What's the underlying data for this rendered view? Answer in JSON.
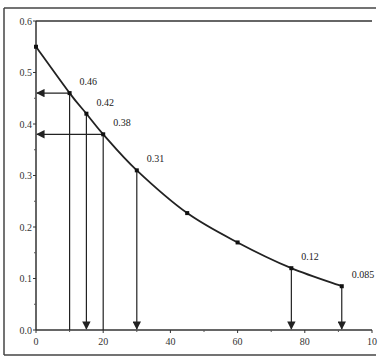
{
  "chart_data": {
    "type": "line",
    "title": "",
    "xlabel": "",
    "ylabel": "",
    "xlim": [
      0,
      100
    ],
    "ylim": [
      0,
      0.6
    ],
    "grid": false,
    "legend": null,
    "x_ticks": [
      "0",
      "20",
      "40",
      "60",
      "80",
      "10"
    ],
    "x_tick_values": [
      0,
      20,
      40,
      60,
      80,
      100
    ],
    "y_ticks": [
      "0.0",
      "0.1",
      "0.2",
      "0.3",
      "0.4",
      "0.5",
      "0.6"
    ],
    "y_tick_values": [
      0,
      0.1,
      0.2,
      0.3,
      0.4,
      0.5,
      0.6
    ],
    "series": [
      {
        "name": "curve",
        "x": [
          0,
          10,
          15,
          20,
          30,
          45,
          60,
          76,
          91
        ],
        "y": [
          0.55,
          0.46,
          0.42,
          0.38,
          0.31,
          0.227,
          0.17,
          0.12,
          0.085
        ]
      }
    ],
    "annotations": [
      {
        "x": 10,
        "y": 0.46,
        "text": "0.46",
        "arrow": "left-to-y-axis"
      },
      {
        "x": 15,
        "y": 0.42,
        "text": "0.42",
        "arrow": "down-to-x-axis"
      },
      {
        "x": 20,
        "y": 0.38,
        "text": "0.38",
        "arrow": "left-to-y-axis"
      },
      {
        "x": 30,
        "y": 0.31,
        "text": "0.31",
        "arrow": "down-to-x-axis"
      },
      {
        "x": 76,
        "y": 0.12,
        "text": "0.12",
        "arrow": "down-to-x-axis"
      },
      {
        "x": 91,
        "y": 0.085,
        "text": "0.085",
        "arrow": "down-to-x-axis"
      }
    ],
    "vertical_guides": [
      10,
      20
    ]
  }
}
